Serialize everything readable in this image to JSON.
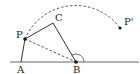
{
  "diagram": {
    "type": "geometry",
    "points": {
      "A": {
        "label": "A",
        "x": 21,
        "y": 62
      },
      "B": {
        "label": "B",
        "x": 76,
        "y": 62
      },
      "C": {
        "label": "C",
        "x": 53,
        "y": 23
      },
      "P": {
        "label": "P",
        "x": 25,
        "y": 39
      },
      "P_prime": {
        "label": "P'",
        "x": 120,
        "y": 28
      }
    },
    "segments": [
      {
        "from": "A",
        "to": "P",
        "style": "solid"
      },
      {
        "from": "P",
        "to": "C",
        "style": "solid"
      },
      {
        "from": "C",
        "to": "B",
        "style": "solid"
      },
      {
        "from": "P",
        "to": "B",
        "style": "dashed"
      }
    ],
    "baseline": {
      "style": "solid",
      "through": [
        "A",
        "B"
      ]
    },
    "arc": {
      "center": "B",
      "from": "P",
      "to": "P_prime",
      "style": "dashed"
    },
    "angle_mark": {
      "vertex": "B",
      "style": "arc"
    },
    "colors": {
      "stroke": "#333333",
      "baseline": "#666666"
    }
  }
}
